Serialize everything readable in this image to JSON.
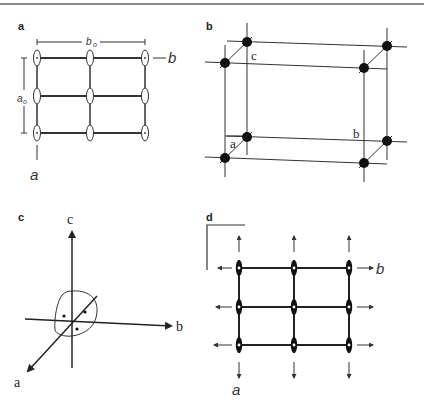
{
  "figure": {
    "panels": {
      "a": {
        "label": "a",
        "axis_b_label": "b",
        "axis_a_label": "a",
        "dim_b_label": "b",
        "dim_b_sub": "o",
        "dim_a_label": "a",
        "dim_a_sub": "o",
        "grid": {
          "columns": 3,
          "rows": 3
        }
      },
      "b": {
        "label": "b",
        "edge_labels": {
          "c": "c",
          "a": "a",
          "b": "b"
        },
        "atoms": 8
      },
      "c": {
        "label": "c",
        "axis_labels": {
          "c": "c",
          "b": "b",
          "a": "a"
        },
        "dots": 3
      },
      "d": {
        "label": "d",
        "axis_b_label": "b",
        "axis_a_label": "a",
        "grid": {
          "columns": 3,
          "rows": 3
        }
      }
    },
    "colors": {
      "ink": "#333333",
      "rule": "#888888",
      "background": "#ffffff"
    }
  }
}
